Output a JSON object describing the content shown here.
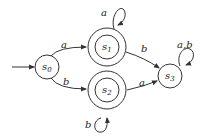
{
  "diagram": {
    "type": "finite-automaton",
    "states": [
      {
        "id": "s0",
        "label": "s",
        "sub": "0",
        "accepting": false,
        "initial": true,
        "cx": 47,
        "cy": 67
      },
      {
        "id": "s1",
        "label": "s",
        "sub": "1",
        "accepting": true,
        "initial": false,
        "cx": 107,
        "cy": 47
      },
      {
        "id": "s2",
        "label": "s",
        "sub": "2",
        "accepting": true,
        "initial": false,
        "cx": 107,
        "cy": 90
      },
      {
        "id": "s3",
        "label": "s",
        "sub": "3",
        "accepting": false,
        "initial": false,
        "cx": 170,
        "cy": 76
      }
    ],
    "transitions": [
      {
        "from": "s0",
        "to": "s1",
        "label": "a"
      },
      {
        "from": "s0",
        "to": "s2",
        "label": "b"
      },
      {
        "from": "s1",
        "to": "s1",
        "label": "a"
      },
      {
        "from": "s1",
        "to": "s3",
        "label": "b"
      },
      {
        "from": "s2",
        "to": "s2",
        "label": "b"
      },
      {
        "from": "s2",
        "to": "s3",
        "label": "a"
      },
      {
        "from": "s3",
        "to": "s3",
        "label": "a,b"
      }
    ]
  }
}
